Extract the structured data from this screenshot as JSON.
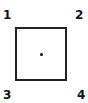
{
  "diagram": {
    "labels": {
      "top_left": "1",
      "top_right": "2",
      "bottom_left": "3",
      "bottom_right": "4"
    },
    "shape": "square",
    "center_marker": "dot"
  }
}
